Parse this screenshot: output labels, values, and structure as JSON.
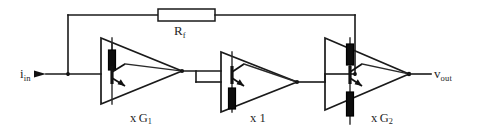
{
  "figure": {
    "background_color": "#ffffff",
    "line_color": "#1a1a1a",
    "text_color": "#262626",
    "width": 480,
    "height": 138
  },
  "labels": {
    "feedback_resistor": "R",
    "feedback_resistor_sub": "f",
    "input_current": "i",
    "input_current_sub": "in",
    "output_voltage": "v",
    "output_voltage_sub": "out",
    "stage1_prefix": "x",
    "stage1_gain": "G",
    "stage1_gain_sub": "1",
    "stage2": "x 1",
    "stage3_prefix": "x",
    "stage3_gain": "G",
    "stage3_gain_sub": "2"
  },
  "components": {
    "feedback_resistor": {
      "name": "Rf",
      "type": "resistor",
      "orientation": "horizontal",
      "x": 158,
      "y": 9,
      "width": 57,
      "height": 12
    },
    "amplifier_1": {
      "name": "xG1",
      "type": "transconductance-amplifier",
      "gain": "G1",
      "apex_x": 182,
      "base_x": 101,
      "top_y": 38,
      "bottom_y": 104,
      "mid_y": 71,
      "has_top_resistor": true,
      "has_bottom_resistor": false,
      "transistor": "npn"
    },
    "amplifier_2": {
      "name": "x1",
      "type": "buffer-amplifier",
      "gain": "1",
      "apex_x": 297,
      "base_x": 221,
      "top_y": 52,
      "bottom_y": 112,
      "mid_y": 82,
      "has_top_resistor": false,
      "has_bottom_resistor": true,
      "transistor": "npn"
    },
    "amplifier_3": {
      "name": "xG2",
      "type": "transconductance-amplifier",
      "gain": "G2",
      "apex_x": 409,
      "base_x": 325,
      "top_y": 38,
      "bottom_y": 110,
      "mid_y": 74,
      "has_top_resistor": true,
      "has_bottom_resistor": true,
      "transistor": "npn"
    }
  },
  "nets": {
    "input_node_x": 68,
    "input_node_y": 74,
    "feedback_top_y": 15,
    "feedback_left_x": 68,
    "feedback_right_x": 355,
    "output_x": 424,
    "output_y": 74
  }
}
